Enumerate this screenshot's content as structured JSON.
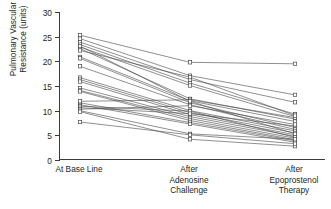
{
  "chart_data": {
    "type": "line",
    "title": "",
    "xlabel": "",
    "ylabel": "Pulmonary Vascular\nResistance (units)",
    "ylim": [
      0,
      30
    ],
    "yticks": [
      0,
      5,
      10,
      15,
      20,
      25,
      30
    ],
    "ytick_labels": [
      "0",
      "5",
      "10",
      "15",
      "20",
      "25",
      "30"
    ],
    "grid": false,
    "legend": "none",
    "marker": "open-square",
    "categories": [
      "At Base Line",
      "After\nAdenosine\nChallenge",
      "After\nEpoprostenol\nTherapy"
    ],
    "category_labels_flat": [
      "At Base Line",
      "After Adenosine Challenge",
      "After Epoprostenol Therapy"
    ],
    "n_subjects": 26,
    "series": [
      {
        "name": "Patient 1",
        "values": [
          25.3,
          19.8,
          19.5
        ]
      },
      {
        "name": "Patient 2",
        "values": [
          24.6,
          17.1,
          13.2
        ]
      },
      {
        "name": "Patient 3",
        "values": [
          23.9,
          16.3,
          11.7
        ]
      },
      {
        "name": "Patient 4",
        "values": [
          23.4,
          15.6,
          9.3
        ]
      },
      {
        "name": "Patient 5",
        "values": [
          22.9,
          15.1,
          8.8
        ]
      },
      {
        "name": "Patient 6",
        "values": [
          22.6,
          12.4,
          8.3
        ]
      },
      {
        "name": "Patient 7",
        "values": [
          20.9,
          12.0,
          7.8
        ]
      },
      {
        "name": "Patient 8",
        "values": [
          20.6,
          11.6,
          6.6
        ]
      },
      {
        "name": "Patient 9",
        "values": [
          19.0,
          11.2,
          6.2
        ]
      },
      {
        "name": "Patient 10",
        "values": [
          16.7,
          10.0,
          5.9
        ]
      },
      {
        "name": "Patient 11",
        "values": [
          16.3,
          9.6,
          5.5
        ]
      },
      {
        "name": "Patient 12",
        "values": [
          15.9,
          9.2,
          5.1
        ]
      },
      {
        "name": "Patient 13",
        "values": [
          14.6,
          8.8,
          4.8
        ]
      },
      {
        "name": "Patient 14",
        "values": [
          14.1,
          8.4,
          4.4
        ]
      },
      {
        "name": "Patient 15",
        "values": [
          13.9,
          8.0,
          4.1
        ]
      },
      {
        "name": "Patient 16",
        "values": [
          11.6,
          7.6,
          3.9
        ]
      },
      {
        "name": "Patient 17",
        "values": [
          11.2,
          7.3,
          3.6
        ]
      },
      {
        "name": "Patient 18",
        "values": [
          10.9,
          9.9,
          4.6
        ]
      },
      {
        "name": "Patient 19",
        "values": [
          10.6,
          9.4,
          6.9
        ]
      },
      {
        "name": "Patient 20",
        "values": [
          10.3,
          11.0,
          7.2
        ]
      },
      {
        "name": "Patient 21",
        "values": [
          10.0,
          5.3,
          4.2
        ]
      },
      {
        "name": "Patient 22",
        "values": [
          9.8,
          4.2,
          2.8
        ]
      },
      {
        "name": "Patient 23",
        "values": [
          11.9,
          12.2,
          8.6
        ]
      },
      {
        "name": "Patient 24",
        "values": [
          22.2,
          16.8,
          9.0
        ]
      },
      {
        "name": "Patient 25",
        "values": [
          23.1,
          11.9,
          5.3
        ]
      },
      {
        "name": "Patient 26",
        "values": [
          7.7,
          5.1,
          3.3
        ]
      }
    ],
    "colors": {
      "line": "#4a4a4a",
      "marker_stroke": "#3b3b3b",
      "marker_fill": "#ffffff",
      "axis": "#3b3b3b",
      "text": "#231f20",
      "background": "#ffffff"
    }
  }
}
